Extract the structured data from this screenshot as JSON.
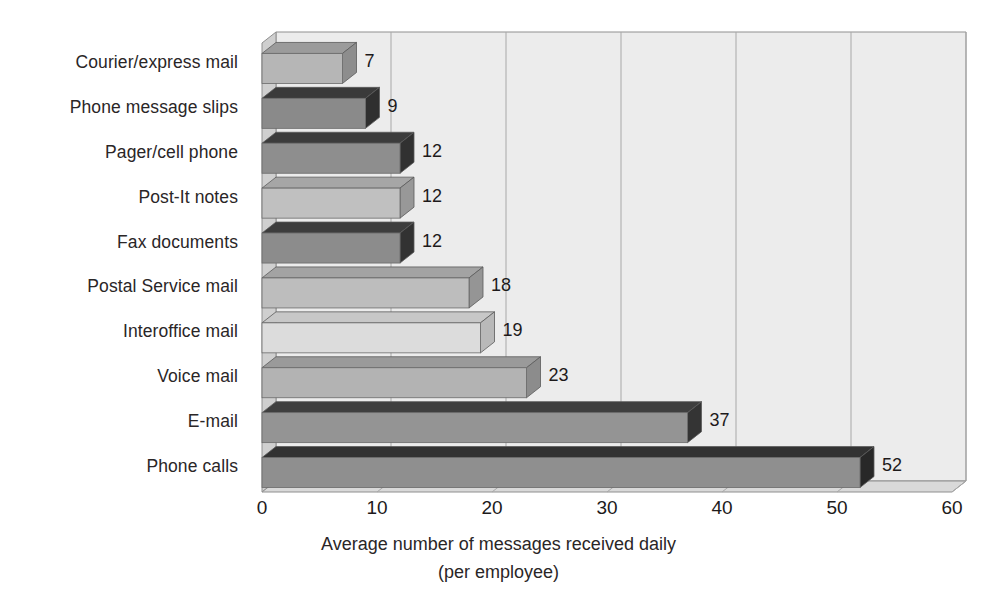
{
  "chart_data": {
    "type": "bar",
    "orientation": "horizontal",
    "title": "",
    "xlabel": "Average number of messages received daily",
    "xlabel_line2": "(per employee)",
    "ylabel": "",
    "xlim": [
      0,
      60
    ],
    "xticks": [
      0,
      10,
      20,
      30,
      40,
      50,
      60
    ],
    "xtick_labels": [
      "0",
      "10",
      "20",
      "30",
      "40",
      "50",
      "60"
    ],
    "grid": true,
    "grid_axis": "x",
    "legend": false,
    "style": "3d-bar",
    "categories": [
      "Courier/express mail",
      "Phone message slips",
      "Pager/cell phone",
      "Post-It notes",
      "Fax documents",
      "Postal Service mail",
      "Interoffice mail",
      "Voice mail",
      "E-mail",
      "Phone calls"
    ],
    "values": [
      7,
      9,
      12,
      12,
      12,
      18,
      19,
      23,
      37,
      52
    ],
    "data_labels": [
      "7",
      "9",
      "12",
      "12",
      "12",
      "18",
      "19",
      "23",
      "37",
      "52"
    ],
    "bar_colors": [
      "#b6b6b6",
      "#8a8a8a",
      "#8e8e8e",
      "#c0c0c0",
      "#8c8c8c",
      "#bdbdbd",
      "#dcdcdc",
      "#b3b3b3",
      "#949494",
      "#8f8f8f"
    ],
    "bar_top_colors": [
      "#9b9b9b",
      "#3a3a3a",
      "#3c3c3c",
      "#a6a6a6",
      "#3d3d3d",
      "#a3a3a3",
      "#c7c7c7",
      "#9a9a9a",
      "#3f3f3f",
      "#323232"
    ],
    "bar_side_colors": [
      "#8d8d8d",
      "#2f2f2f",
      "#313131",
      "#989898",
      "#323232",
      "#959595",
      "#b9b9b9",
      "#8c8c8c",
      "#343434",
      "#282828"
    ]
  },
  "colors": {
    "plot_background": "#ececec",
    "floor": "#d9d9d9",
    "wall_left": "#cfcfcf",
    "gridline": "#a8a8a8",
    "axis_line": "#8f8f8f",
    "text": "#231f20",
    "page_background": "#ffffff"
  }
}
